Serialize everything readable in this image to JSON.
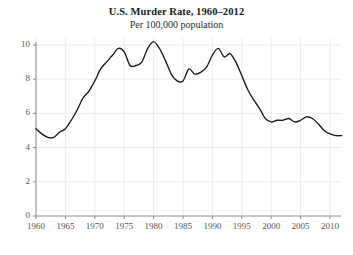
{
  "chart_data": {
    "type": "line",
    "title": "U.S. Murder Rate, 1960–2012",
    "subtitle": "Per 100,000 population",
    "xlabel": "",
    "ylabel": "",
    "xlim": [
      1960,
      2012
    ],
    "ylim": [
      0,
      10.6
    ],
    "grid": true,
    "legend": "none",
    "line_color": "#1a1a1a",
    "grid_color": "#ececec",
    "axis_color": "#8a8c8e",
    "tick_label_color": "#55575a",
    "background_color": "#ffffff",
    "xticks": [
      1960,
      1965,
      1970,
      1975,
      1980,
      1985,
      1990,
      1995,
      2000,
      2005,
      2010
    ],
    "xtick_labels": [
      "1960",
      "1965",
      "1970",
      "1975",
      "1980",
      "1985",
      "1990",
      "1995",
      "2000",
      "2005",
      "2010"
    ],
    "yticks": [
      0,
      2,
      4,
      6,
      8,
      10
    ],
    "ytick_labels": [
      "0",
      "2",
      "4",
      "6",
      "8",
      "10"
    ],
    "series": [
      {
        "name": "U.S. murder rate per 100,000",
        "x": [
          1960,
          1961,
          1962,
          1963,
          1964,
          1965,
          1966,
          1967,
          1968,
          1969,
          1970,
          1971,
          1972,
          1973,
          1974,
          1975,
          1976,
          1977,
          1978,
          1979,
          1980,
          1981,
          1982,
          1983,
          1984,
          1985,
          1986,
          1987,
          1988,
          1989,
          1990,
          1991,
          1992,
          1993,
          1994,
          1995,
          1996,
          1997,
          1998,
          1999,
          2000,
          2001,
          2002,
          2003,
          2004,
          2005,
          2006,
          2007,
          2008,
          2009,
          2010,
          2011,
          2012
        ],
        "values": [
          5.1,
          4.8,
          4.6,
          4.6,
          4.9,
          5.1,
          5.6,
          6.2,
          6.9,
          7.3,
          7.9,
          8.6,
          9.0,
          9.4,
          9.8,
          9.6,
          8.8,
          8.8,
          9.0,
          9.8,
          10.2,
          9.8,
          9.1,
          8.3,
          7.9,
          7.9,
          8.6,
          8.3,
          8.4,
          8.7,
          9.4,
          9.8,
          9.3,
          9.5,
          9.0,
          8.2,
          7.4,
          6.8,
          6.3,
          5.7,
          5.5,
          5.6,
          5.6,
          5.7,
          5.5,
          5.6,
          5.8,
          5.7,
          5.4,
          5.0,
          4.8,
          4.7,
          4.7
        ]
      }
    ]
  }
}
